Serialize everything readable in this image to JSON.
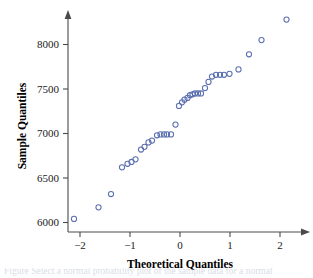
{
  "figure": {
    "width": 313,
    "height": 278,
    "background": "#ffffff"
  },
  "caption": {
    "text": "Figure   Select a normal probability plot of the sample data for a normal"
  },
  "chart_data": {
    "type": "scatter",
    "title": "",
    "xlabel": "Theoretical Quantiles",
    "ylabel": "Sample Quantiles",
    "xlim": [
      -2.45,
      2.4
    ],
    "ylim": [
      5880,
      8400
    ],
    "grid": false,
    "legend": null,
    "marker": {
      "shape": "open-circle",
      "color": "#5a6fb0",
      "radius": 2.6
    },
    "xticks": [
      -2,
      -1,
      0,
      1,
      2
    ],
    "xtick_labels": [
      "−2",
      "−1",
      "0",
      "1",
      "2"
    ],
    "yticks": [
      6000,
      6500,
      7000,
      7500,
      8000
    ],
    "ytick_labels": [
      "6000",
      "6500",
      "7000",
      "7500",
      "8000"
    ],
    "x": [
      -2.12,
      -1.63,
      -1.38,
      -1.16,
      -1.05,
      -0.97,
      -0.89,
      -0.78,
      -0.71,
      -0.63,
      -0.56,
      -0.46,
      -0.39,
      -0.32,
      -0.26,
      -0.18,
      -0.09,
      -0.02,
      0.04,
      0.09,
      0.15,
      0.2,
      0.25,
      0.3,
      0.36,
      0.42,
      0.5,
      0.57,
      0.64,
      0.72,
      0.8,
      0.88,
      0.99,
      1.17,
      1.38,
      1.63,
      2.13
    ],
    "y": [
      6040,
      6170,
      6320,
      6620,
      6660,
      6680,
      6710,
      6820,
      6850,
      6900,
      6920,
      6980,
      6990,
      6990,
      6990,
      6990,
      7100,
      7310,
      7350,
      7380,
      7400,
      7430,
      7440,
      7450,
      7450,
      7450,
      7510,
      7580,
      7640,
      7660,
      7660,
      7660,
      7670,
      7720,
      7890,
      8050,
      8280
    ]
  }
}
